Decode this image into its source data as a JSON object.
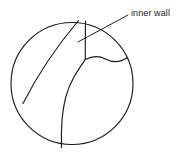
{
  "figure": {
    "background_color": "#ffffff",
    "line_color": "#1a1a1a",
    "width": 190,
    "height": 157
  },
  "annotation": {
    "label": "inner wall",
    "leader_line": {
      "from_x": 128,
      "from_y": 15,
      "to_x": 78,
      "to_y": 42
    }
  },
  "geometry": {
    "outer_circle": {
      "name": "outer-boundary",
      "center_x": 72,
      "center_y": 83.5,
      "radius": 61
    },
    "paths": [
      {
        "name": "left-diagonal-wall",
        "d": "M 78.5 20.5 C 62 40 40 70 23 103.5"
      },
      {
        "name": "vertical-wall-segment",
        "d": "M 85.5 21 C 85.3 33 85.2 47 85.3 59.5"
      },
      {
        "name": "upper-right-wall-curve",
        "d": "M 85.3 59.5 C 93 55.5 99 55.5 105.5 59 C 113 63 120 62.5 127.5 57.5"
      },
      {
        "name": "lower-inner-wall-curve",
        "d": "M 85.3 59.5 C 78 70 69.5 82 65.5 98 C 61.5 114 61 132 61.5 147.5"
      }
    ]
  }
}
